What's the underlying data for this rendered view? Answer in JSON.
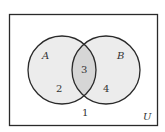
{
  "diagram": {
    "type": "venn",
    "universe_label": "U",
    "sets": [
      {
        "label": "A",
        "region_count": "2"
      },
      {
        "label": "B",
        "region_count": "4"
      }
    ],
    "intersection_count": "3",
    "outside_count": "1",
    "colors": {
      "background": "#ffffff",
      "stroke": "#2a2a2a",
      "set_fill": "#ececec",
      "intersection_fill": "#d6d6d6"
    }
  }
}
